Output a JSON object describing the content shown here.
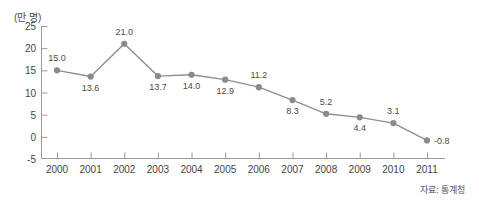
{
  "figure": {
    "unit_label": "(만 명)",
    "source_note": "자료: 통계청",
    "line_color": "#8e8e8e",
    "marker_color": "#8a8a8a",
    "axis_color": "#9a9a9a",
    "text_color": "#444444"
  },
  "chart_data": {
    "type": "line",
    "title": "",
    "subtitle": "",
    "xlabel": "",
    "ylabel": "(만 명)",
    "categories": [
      "2000",
      "2001",
      "2002",
      "2003",
      "2004",
      "2005",
      "2006",
      "2007",
      "2008",
      "2009",
      "2010",
      "2011"
    ],
    "values": [
      15.0,
      13.6,
      21.0,
      13.7,
      14.0,
      12.9,
      11.2,
      8.3,
      5.2,
      4.4,
      3.1,
      -0.8
    ],
    "point_labels": [
      "15.0",
      "13.6",
      "21.0",
      "13.7",
      "14.0",
      "12.9",
      "11.2",
      "8.3",
      "5.2",
      "4.4",
      "3.1",
      "-0.8"
    ],
    "label_positions": [
      "above",
      "below",
      "above",
      "below",
      "below",
      "below",
      "above",
      "below",
      "above",
      "below",
      "above",
      "right"
    ],
    "ylim": [
      -5,
      25
    ],
    "yticks": [
      25,
      20,
      15,
      10,
      5,
      0,
      -5
    ],
    "ytick_labels": [
      "25",
      "20",
      "15",
      "10",
      "5",
      "0",
      "-5"
    ],
    "grid": false,
    "legend": "none",
    "annotations": [
      "자료: 통계청"
    ]
  }
}
